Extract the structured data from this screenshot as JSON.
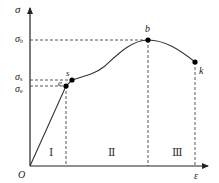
{
  "diagram": {
    "axes": {
      "y_label": "σ",
      "x_label": "ε",
      "origin_label": "O"
    },
    "y_ticks": [
      {
        "symbol": "σ",
        "sub": "b",
        "y": 40
      },
      {
        "symbol": "σ",
        "sub": "s",
        "y": 80
      },
      {
        "symbol": "σ",
        "sub": "e",
        "y": 86
      }
    ],
    "points": [
      {
        "label": "e",
        "x": 66,
        "y": 86
      },
      {
        "label": "s",
        "x": 72,
        "y": 80
      },
      {
        "label": "b",
        "x": 148,
        "y": 40
      },
      {
        "label": "k",
        "x": 195,
        "y": 62
      }
    ],
    "regions": [
      {
        "label": "Ⅰ",
        "x": 49,
        "y": 147
      },
      {
        "label": "Ⅱ",
        "x": 108,
        "y": 147
      },
      {
        "label": "Ⅲ",
        "x": 172,
        "y": 147
      }
    ],
    "colors": {
      "line": "#333333",
      "dash": "#444444",
      "point": "#000000"
    }
  }
}
